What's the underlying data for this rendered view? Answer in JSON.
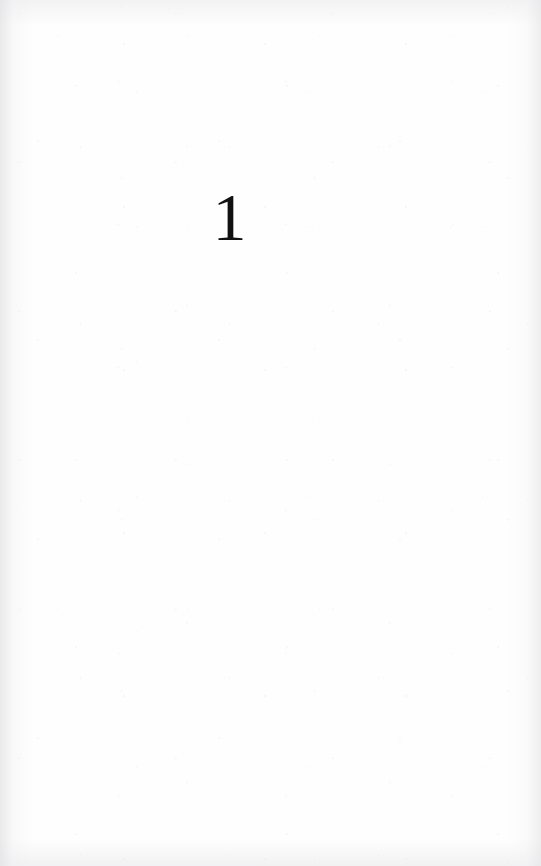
{
  "page": {
    "kind": "scanned-book-page",
    "paper_color": "#fefefe",
    "ink_color": "#111111"
  },
  "content": {
    "chapter_number": "1"
  }
}
